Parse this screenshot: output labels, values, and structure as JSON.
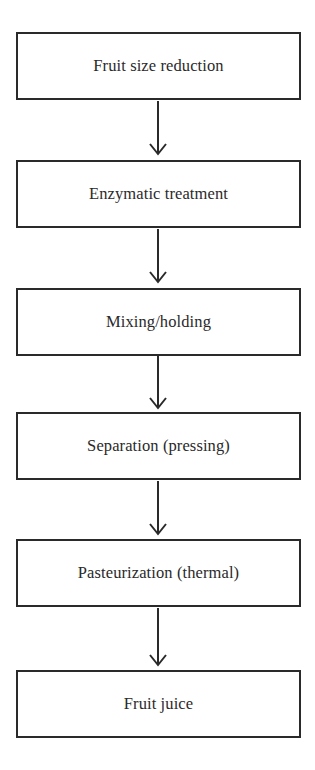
{
  "diagram": {
    "type": "flowchart",
    "direction": "top-to-bottom",
    "colors": {
      "stroke": "#2a2a2a",
      "text": "#2a2a2a",
      "background": "#ffffff"
    },
    "steps": [
      {
        "label": "Fruit size reduction"
      },
      {
        "label": "Enzymatic treatment"
      },
      {
        "label": "Mixing/holding"
      },
      {
        "label": "Separation (pressing)"
      },
      {
        "label": "Pasteurization (thermal)"
      },
      {
        "label": "Fruit juice"
      }
    ],
    "arrows": [
      {
        "from": 0,
        "to": 1,
        "icon": "arrow-down-icon"
      },
      {
        "from": 1,
        "to": 2,
        "icon": "arrow-down-icon"
      },
      {
        "from": 2,
        "to": 3,
        "icon": "arrow-down-icon"
      },
      {
        "from": 3,
        "to": 4,
        "icon": "arrow-down-icon"
      },
      {
        "from": 4,
        "to": 5,
        "icon": "arrow-down-icon"
      }
    ]
  }
}
